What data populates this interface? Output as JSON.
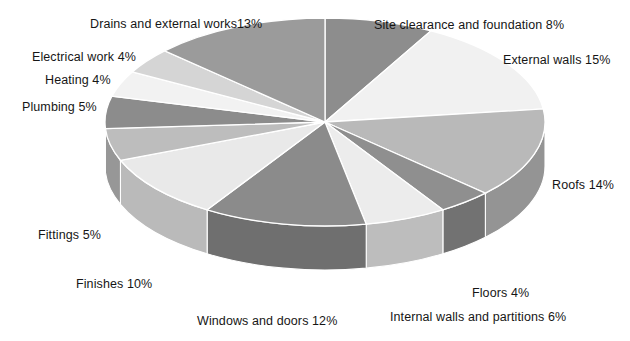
{
  "chart_data": {
    "type": "pie",
    "title": "",
    "subtitle": "",
    "xlabel": "",
    "ylabel": "",
    "grid": false,
    "legend_position": "none",
    "style": "3d-exploded-pie",
    "unit": "%",
    "total": 100,
    "categories": [
      "Site clearance and foundation",
      "External walls",
      "Roofs",
      "Floors",
      "Internal walls and partitions",
      "Windows and doors",
      "Finishes",
      "Fittings",
      "Plumbing",
      "Heating",
      "Electrical work",
      "Drains and external works"
    ],
    "values": [
      8,
      15,
      14,
      4,
      6,
      12,
      10,
      5,
      5,
      4,
      4,
      13
    ],
    "slice_colors": [
      "#8d8d8d",
      "#f1f1f1",
      "#b9b9b9",
      "#8f8f8f",
      "#ececec",
      "#8b8b8b",
      "#e9e9e9",
      "#bdbdbd",
      "#8c8c8c",
      "#f2f2f2",
      "#d5d5d5",
      "#9b9b9b"
    ],
    "annotations": [
      {
        "text": "Site clearance and foundation 8%",
        "x": 374,
        "y": 18
      },
      {
        "text": "External walls 15%",
        "x": 503,
        "y": 53
      },
      {
        "text": "Roofs 14%",
        "x": 552,
        "y": 178
      },
      {
        "text": "Floors 4%",
        "x": 472,
        "y": 286
      },
      {
        "text": "Internal walls and partitions 6%",
        "x": 390,
        "y": 310
      },
      {
        "text": "Windows and doors 12%",
        "x": 197,
        "y": 314
      },
      {
        "text": "Finishes 10%",
        "x": 76,
        "y": 277
      },
      {
        "text": "Fittings 5%",
        "x": 38,
        "y": 228
      },
      {
        "text": "Plumbing 5%",
        "x": 22,
        "y": 100
      },
      {
        "text": "Heating 4%",
        "x": 45,
        "y": 73
      },
      {
        "text": "Electrical work 4%",
        "x": 32,
        "y": 50
      },
      {
        "text": "Drains and external works13%",
        "x": 90,
        "y": 17
      }
    ]
  },
  "labels": {
    "site_clearance": "Site clearance and foundation 8%",
    "external_walls": "External walls 15%",
    "roofs": "Roofs 14%",
    "floors": "Floors 4%",
    "internal_walls": "Internal walls and partitions 6%",
    "windows_doors": "Windows and doors 12%",
    "finishes": "Finishes 10%",
    "fittings": "Fittings 5%",
    "plumbing": "Plumbing 5%",
    "heating": "Heating 4%",
    "electrical": "Electrical work 4%",
    "drains": "Drains and external works13%"
  },
  "colors": {
    "background": "#ffffff",
    "text": "#161616",
    "slice_edge": "#ffffff"
  }
}
